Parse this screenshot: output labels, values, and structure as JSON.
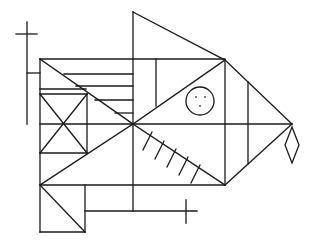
{
  "figure": {
    "title": "Complex geometric line figure (fish-like Rey-Osterrieth style figure)",
    "stroke_color": "#1a1a1a",
    "background": "#ffffff",
    "width": 315,
    "height": 245
  },
  "elements": {
    "main_rectangle": {
      "x1": 40,
      "y1": 59,
      "x2": 225,
      "y2": 124
    },
    "center_point": {
      "x": 133,
      "y": 124
    },
    "top_triangle": {
      "apex": [
        133,
        12
      ],
      "right": [
        225,
        60
      ],
      "base": [
        133,
        59
      ]
    },
    "head_triangle_right": {
      "top": [
        225,
        60
      ],
      "tip": [
        292,
        124
      ],
      "bottom": [
        225,
        185
      ]
    },
    "eye_circle": {
      "cx": 200,
      "cy": 101,
      "r": 14,
      "dots": [
        [
          196,
          97
        ],
        [
          205,
          97
        ],
        [
          200,
          106
        ]
      ]
    },
    "tail_diamond": {
      "points": [
        [
          292,
          127
        ],
        [
          299,
          145
        ],
        [
          292,
          163
        ],
        [
          285,
          145
        ]
      ]
    },
    "cross_top_left": {
      "vertical": [
        27,
        22,
        27,
        124
      ],
      "horizontal": [
        16,
        34,
        37,
        34
      ],
      "connector": [
        27,
        73,
        40,
        73
      ]
    },
    "cross_bottom_right": {
      "vertical": [
        186,
        200,
        186,
        223
      ],
      "horizontal": [
        90,
        211,
        197,
        211
      ]
    },
    "hatch_marks": 5
  }
}
